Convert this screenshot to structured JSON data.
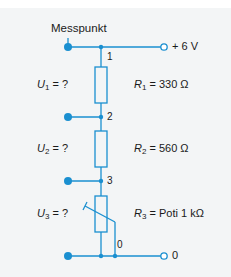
{
  "diagram": {
    "type": "voltage-divider-circuit",
    "colors": {
      "wire": "#1a8fd0",
      "background": "#f3f5f6",
      "text": "#1a1a1a"
    },
    "measure_point_label": "Messpunkt",
    "supply": {
      "label": "+ 6 V"
    },
    "ground": {
      "label": "0"
    },
    "nodes": [
      {
        "id": "1",
        "label": "1"
      },
      {
        "id": "2",
        "label": "2"
      },
      {
        "id": "3",
        "label": "3"
      },
      {
        "id": "0",
        "label": "0"
      }
    ],
    "voltages": [
      {
        "symbol": "U",
        "sub": "1",
        "value": " = ?"
      },
      {
        "symbol": "U",
        "sub": "2",
        "value": " = ?"
      },
      {
        "symbol": "U",
        "sub": "3",
        "value": " = ?"
      }
    ],
    "resistors": [
      {
        "symbol": "R",
        "sub": "1",
        "value": " = 330 Ω"
      },
      {
        "symbol": "R",
        "sub": "2",
        "value": " = 560 Ω"
      },
      {
        "symbol": "R",
        "sub": "3",
        "value": " = Poti 1 kΩ"
      }
    ]
  }
}
